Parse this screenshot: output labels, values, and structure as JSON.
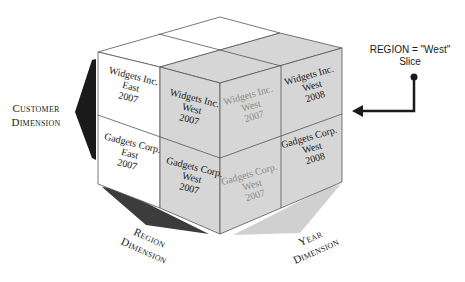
{
  "colors": {
    "slice_fill": "#d6d6d6",
    "unselected_fill": "#ffffff",
    "edge": "#555555",
    "customer_arrow": "#1a1a1a",
    "region_arrow": "#3c3c3c",
    "year_arrow": "#d0d0d0",
    "hidden_text": "#8a8a8a"
  },
  "cube": {
    "left_face": [
      {
        "customer": "Widgets Inc.",
        "region": "East",
        "year": "2007",
        "text": "Widgets Inc.\nEast\n2007",
        "in_slice": false
      },
      {
        "customer": "Widgets Inc.",
        "region": "West",
        "year": "2007",
        "text": "Widgets Inc.\nWest\n2007",
        "in_slice": true
      },
      {
        "customer": "Gadgets Corp.",
        "region": "East",
        "year": "2007",
        "text": "Gadgets Corp.\nEast\n2007",
        "in_slice": false
      },
      {
        "customer": "Gadgets Corp.",
        "region": "West",
        "year": "2007",
        "text": "Gadgets Corp.\nWest\n2007",
        "in_slice": true
      }
    ],
    "right_face": [
      {
        "customer": "Widgets Inc.",
        "region": "West",
        "year": "2007",
        "text": "Widgets Inc.\nWest\n2007",
        "in_slice": true,
        "ghosted": true
      },
      {
        "customer": "Widgets Inc.",
        "region": "West",
        "year": "2008",
        "text": "Widgets Inc.\nWest\n2008",
        "in_slice": true
      },
      {
        "customer": "Gadgets Corp.",
        "region": "West",
        "year": "2007",
        "text": "Gadgets Corp.\nWest\n2007",
        "in_slice": true,
        "ghosted": true
      },
      {
        "customer": "Gadgets Corp.",
        "region": "West",
        "year": "2008",
        "text": "Gadgets Corp.\nWest\n2008",
        "in_slice": true
      }
    ]
  },
  "dimensions": {
    "customer": "Customer\nDimension",
    "region": "Region\nDimension",
    "year": "Year\nDimension"
  },
  "callout": {
    "line1": "REGION = \"West\"",
    "line2": "Slice"
  }
}
